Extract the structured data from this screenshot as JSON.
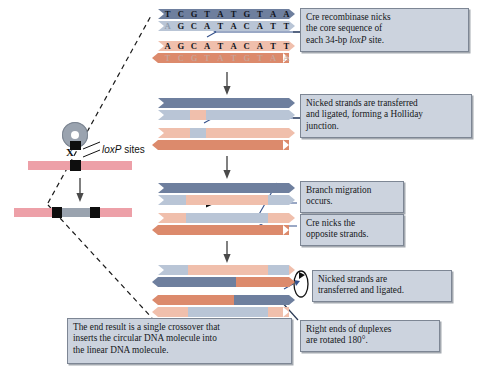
{
  "figure": {
    "colors": {
      "strand_dark_blue": "#6e7f9e",
      "strand_light_blue": "#b9c5d6",
      "strand_salmon": "#e8a48c",
      "strand_dark_salmon": "#dc8a6c",
      "callout_fill": "#ccd3de",
      "callout_border": "#7d8694",
      "pink_dna": "#eda0a8",
      "gray_circle": "#9aa3af",
      "nick_arrow": "#36528c"
    }
  },
  "overview": {
    "loxp_label": "loxP sites",
    "crossover_mark": "X",
    "circle_name": "circular-dna-plasmid",
    "linear_name": "linear-dna-molecule",
    "result_name": "integrated-dna-molecule"
  },
  "sequences": {
    "top_strand_upper": [
      "T",
      "C",
      "G",
      "T",
      "A",
      "T",
      "G",
      "T",
      "A",
      "A"
    ],
    "top_strand_lower": [
      "A",
      "G",
      "C",
      "A",
      "T",
      "A",
      "C",
      "A",
      "T",
      "T"
    ],
    "bottom_strand_upper": [
      "A",
      "G",
      "C",
      "A",
      "T",
      "A",
      "C",
      "A",
      "T",
      "T"
    ],
    "bottom_strand_lower": [
      "T",
      "C",
      "G",
      "T",
      "A",
      "T",
      "G",
      "T",
      "A",
      "A"
    ]
  },
  "callouts": [
    {
      "id": "callout-nick-core",
      "lines": [
        "Cre recombinase nicks",
        "the core sequence of",
        "each 34-bp loxP site."
      ],
      "italic_token": "loxP"
    },
    {
      "id": "callout-holliday",
      "lines": [
        "Nicked strands are transferred",
        "and ligated, forming a Holliday",
        "junction."
      ]
    },
    {
      "id": "callout-branch-migration",
      "lines": [
        "Branch migration",
        "occurs."
      ]
    },
    {
      "id": "callout-cre-nicks-opposite",
      "lines": [
        "Cre nicks the",
        "opposite strands."
      ]
    },
    {
      "id": "callout-transferred-ligated",
      "lines": [
        "Nicked strands are",
        "transferred and ligated."
      ]
    },
    {
      "id": "callout-rotated",
      "lines": [
        "Right ends of duplexes",
        "are rotated 180°."
      ]
    },
    {
      "id": "callout-end-result",
      "lines": [
        "The end result is a single crossover that",
        "inserts the circular DNA molecule into",
        "the linear DNA molecule."
      ]
    }
  ],
  "steps": [
    {
      "id": "step-1-nicked-core",
      "label": "loxP duplexes with nicked core sequences"
    },
    {
      "id": "step-2-holliday-junction",
      "label": "Holliday junction intermediate"
    },
    {
      "id": "step-3-branch-migration",
      "label": "Branch migration and second nicking"
    },
    {
      "id": "step-4-resolved",
      "label": "Resolved recombinant duplexes"
    }
  ]
}
